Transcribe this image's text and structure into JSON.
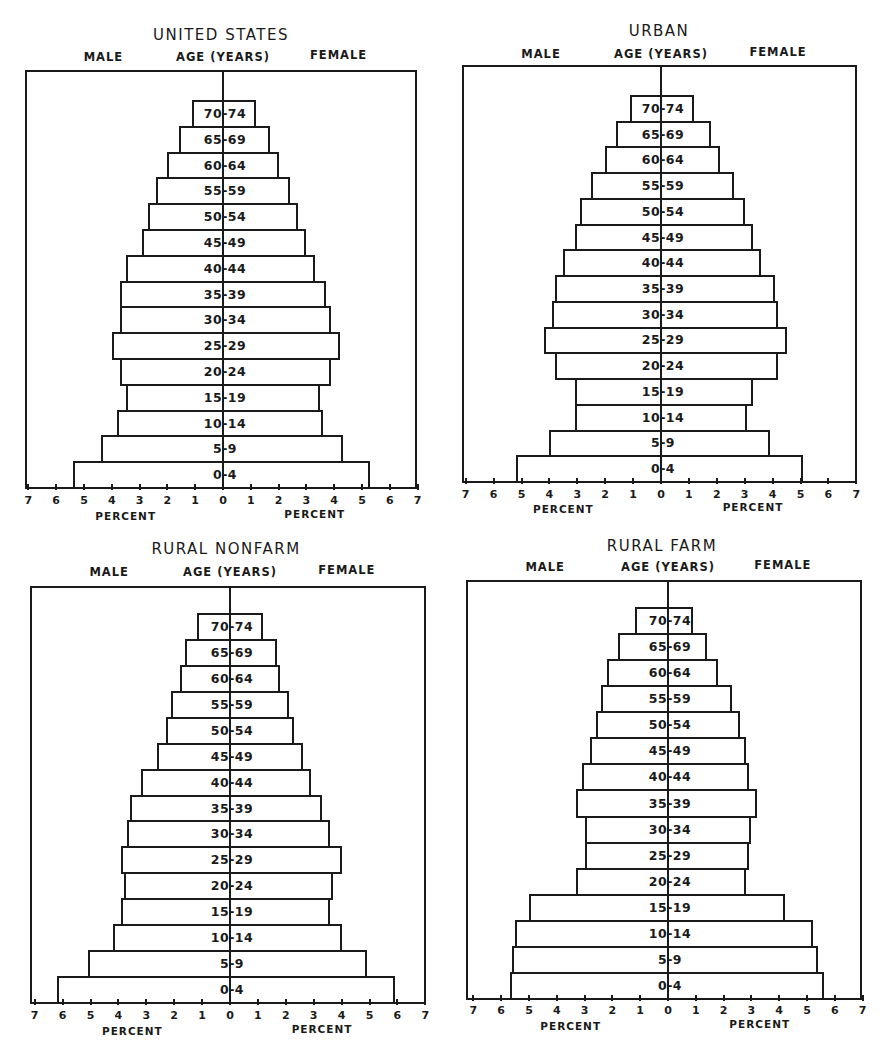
{
  "labels": {
    "male": "MALE",
    "female": "FEMALE",
    "age": "AGE (YEARS)",
    "percent": "PERCENT"
  },
  "chart_data": [
    {
      "type": "bar",
      "subtype": "population-pyramid",
      "title": "UNITED STATES",
      "xlabel": "PERCENT",
      "ylabel": "AGE (YEARS)",
      "xlim": [
        -7,
        7
      ],
      "x_ticks": [
        7,
        6,
        5,
        4,
        3,
        2,
        1,
        0,
        1,
        2,
        3,
        4,
        5,
        6,
        7
      ],
      "categories": [
        "0-4",
        "5-9",
        "10-14",
        "15-19",
        "20-24",
        "25-29",
        "30-34",
        "35-39",
        "40-44",
        "45-49",
        "50-54",
        "55-59",
        "60-64",
        "65-69",
        "70-74"
      ],
      "series": [
        {
          "name": "MALE",
          "values": [
            5.4,
            4.4,
            3.8,
            3.5,
            3.7,
            4.0,
            3.7,
            3.7,
            3.5,
            2.9,
            2.7,
            2.4,
            2.0,
            1.6,
            1.1
          ]
        },
        {
          "name": "FEMALE",
          "values": [
            5.3,
            4.3,
            3.6,
            3.5,
            3.9,
            4.2,
            3.9,
            3.7,
            3.3,
            3.0,
            2.7,
            2.4,
            2.0,
            1.7,
            1.2
          ]
        }
      ],
      "layout": {
        "left": 25,
        "top": 70,
        "right": 417,
        "bottom": 487,
        "zero": 223,
        "scale": 27.8,
        "bar_top": 100,
        "title_y": 26,
        "sub_y": 50,
        "tick_y": 494,
        "pct_y": 510,
        "title_x": 221
      }
    },
    {
      "type": "bar",
      "subtype": "population-pyramid",
      "title": "URBAN",
      "xlabel": "PERCENT",
      "ylabel": "AGE (YEARS)",
      "xlim": [
        -7,
        7
      ],
      "x_ticks": [
        7,
        6,
        5,
        4,
        3,
        2,
        1,
        0,
        1,
        2,
        3,
        4,
        5,
        6,
        7
      ],
      "categories": [
        "0-4",
        "5-9",
        "10-14",
        "15-19",
        "20-24",
        "25-29",
        "30-34",
        "35-39",
        "40-44",
        "45-49",
        "50-54",
        "55-59",
        "60-64",
        "65-69",
        "70-74"
      ],
      "series": [
        {
          "name": "MALE",
          "values": [
            5.2,
            4.0,
            3.1,
            3.1,
            3.8,
            4.2,
            3.9,
            3.8,
            3.5,
            3.1,
            2.9,
            2.5,
            2.0,
            1.6,
            1.1
          ]
        },
        {
          "name": "FEMALE",
          "values": [
            5.1,
            3.9,
            3.1,
            3.3,
            4.2,
            4.5,
            4.2,
            4.1,
            3.6,
            3.3,
            3.0,
            2.6,
            2.1,
            1.8,
            1.2
          ]
        }
      ],
      "layout": {
        "left": 462,
        "top": 65,
        "right": 857,
        "bottom": 481,
        "zero": 661,
        "scale": 27.9,
        "bar_top": 95,
        "title_y": 22,
        "sub_y": 47,
        "tick_y": 488,
        "pct_y": 503,
        "title_x": 659
      }
    },
    {
      "type": "bar",
      "subtype": "population-pyramid",
      "title": "RURAL NONFARM",
      "xlabel": "PERCENT",
      "ylabel": "AGE (YEARS)",
      "xlim": [
        -7,
        7
      ],
      "x_ticks": [
        7,
        6,
        5,
        4,
        3,
        2,
        1,
        0,
        1,
        2,
        3,
        4,
        5,
        6,
        7
      ],
      "categories": [
        "0-4",
        "5-9",
        "10-14",
        "15-19",
        "20-24",
        "25-29",
        "30-34",
        "35-39",
        "40-44",
        "45-49",
        "50-54",
        "55-59",
        "60-64",
        "65-69",
        "70-74"
      ],
      "series": [
        {
          "name": "MALE",
          "values": [
            6.2,
            5.1,
            4.2,
            3.9,
            3.8,
            3.9,
            3.7,
            3.6,
            3.2,
            2.6,
            2.3,
            2.1,
            1.8,
            1.6,
            1.2
          ]
        },
        {
          "name": "FEMALE",
          "values": [
            5.9,
            4.9,
            4.0,
            3.6,
            3.7,
            4.0,
            3.6,
            3.3,
            2.9,
            2.6,
            2.3,
            2.1,
            1.8,
            1.7,
            1.2
          ]
        }
      ],
      "layout": {
        "left": 30,
        "top": 586,
        "right": 426,
        "bottom": 1002,
        "zero": 230,
        "scale": 27.9,
        "bar_top": 613,
        "title_y": 540,
        "sub_y": 565,
        "tick_y": 1009,
        "pct_y": 1025,
        "title_x": 226
      }
    },
    {
      "type": "bar",
      "subtype": "population-pyramid",
      "title": "RURAL FARM",
      "xlabel": "PERCENT",
      "ylabel": "AGE (YEARS)",
      "xlim": [
        -7,
        7
      ],
      "x_ticks": [
        7,
        6,
        5,
        4,
        3,
        2,
        1,
        0,
        1,
        2,
        3,
        4,
        5,
        6,
        7
      ],
      "categories": [
        "0-4",
        "5-9",
        "10-14",
        "15-19",
        "20-24",
        "25-29",
        "30-34",
        "35-39",
        "40-44",
        "45-49",
        "50-54",
        "55-59",
        "60-64",
        "65-69",
        "70-74"
      ],
      "series": [
        {
          "name": "MALE",
          "values": [
            5.7,
            5.6,
            5.5,
            5.0,
            3.3,
            3.0,
            3.0,
            3.3,
            3.1,
            2.8,
            2.6,
            2.4,
            2.2,
            1.8,
            1.2
          ]
        },
        {
          "name": "FEMALE",
          "values": [
            5.6,
            5.4,
            5.2,
            4.2,
            2.8,
            2.9,
            3.0,
            3.2,
            2.9,
            2.8,
            2.6,
            2.3,
            1.8,
            1.4,
            0.9
          ]
        }
      ],
      "layout": {
        "left": 466,
        "top": 580,
        "right": 862,
        "bottom": 998,
        "zero": 668,
        "scale": 27.8,
        "bar_top": 607,
        "title_y": 537,
        "sub_y": 560,
        "tick_y": 1004,
        "pct_y": 1020,
        "title_x": 662
      }
    }
  ]
}
